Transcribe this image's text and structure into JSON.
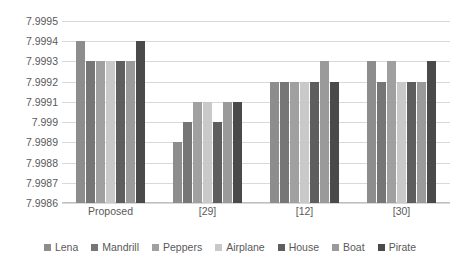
{
  "chart_data": {
    "type": "bar",
    "title": "",
    "subtitle": "",
    "xlabel": "",
    "ylabel": "",
    "categories": [
      "Proposed",
      "[29]",
      "[12]",
      "[30]"
    ],
    "series": [
      {
        "name": "Lena",
        "color": "#8d8d8d",
        "values": [
          7.9994,
          7.9989,
          7.9992,
          7.9993
        ]
      },
      {
        "name": "Mandrill",
        "color": "#767676",
        "values": [
          7.9993,
          7.999,
          7.9992,
          7.9992
        ]
      },
      {
        "name": "Peppers",
        "color": "#a0a0a0",
        "values": [
          7.9993,
          7.9991,
          7.9992,
          7.9993
        ]
      },
      {
        "name": "Airplane",
        "color": "#c9c9c9",
        "values": [
          7.9993,
          7.9991,
          7.9992,
          7.9992
        ]
      },
      {
        "name": "House",
        "color": "#5e5e5e",
        "values": [
          7.9993,
          7.999,
          7.9992,
          7.9992
        ]
      },
      {
        "name": "Boat",
        "color": "#9a9a9a",
        "values": [
          7.9993,
          7.9991,
          7.9993,
          7.9992
        ]
      },
      {
        "name": "Pirate",
        "color": "#4a4a4a",
        "values": [
          7.9994,
          7.9991,
          7.9992,
          7.9993
        ]
      }
    ],
    "yticks": [
      "7.9995",
      "7.9994",
      "7.9993",
      "7.9992",
      "7.9991",
      "7.999",
      "7.9989",
      "7.9988",
      "7.9987",
      "7.9986"
    ],
    "ytick_values": [
      7.9995,
      7.9994,
      7.9993,
      7.9992,
      7.9991,
      7.999,
      7.9989,
      7.9988,
      7.9987,
      7.9986
    ],
    "ylim": [
      7.9986,
      7.9995
    ],
    "grid": true,
    "legend_position": "bottom"
  }
}
